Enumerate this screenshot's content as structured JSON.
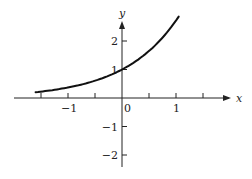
{
  "chart_data": {
    "type": "line",
    "title": "",
    "function": "y = e^x",
    "xlabel": "x",
    "ylabel": "y",
    "x_ticks": [
      -1.5,
      -1,
      -0.5,
      0,
      0.5,
      1,
      1.5
    ],
    "x_tick_labels": [
      {
        "value": -1,
        "text": "−1"
      },
      {
        "value": 0,
        "text": "0"
      },
      {
        "value": 1,
        "text": "1"
      }
    ],
    "y_ticks": [
      -2,
      -1,
      1,
      2
    ],
    "y_tick_labels": [
      {
        "value": 2,
        "text": "2"
      },
      {
        "value": 1,
        "text": "1"
      },
      {
        "value": -1,
        "text": "−1"
      },
      {
        "value": -2,
        "text": "−2"
      }
    ],
    "xlim": [
      -2.2,
      2.0
    ],
    "ylim": [
      -2.4,
      2.9
    ],
    "grid": false,
    "legend": null,
    "series": [
      {
        "name": "e^x",
        "x": [
          -1.6,
          -1.4,
          -1.2,
          -1.0,
          -0.8,
          -0.6,
          -0.4,
          -0.2,
          0.0,
          0.2,
          0.4,
          0.6,
          0.8,
          1.0,
          1.05
        ],
        "y": [
          0.2,
          0.25,
          0.3,
          0.37,
          0.45,
          0.55,
          0.67,
          0.82,
          1.0,
          1.22,
          1.49,
          1.82,
          2.23,
          2.72,
          2.86
        ]
      }
    ]
  }
}
